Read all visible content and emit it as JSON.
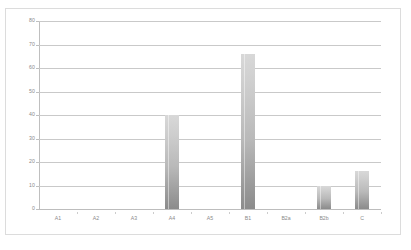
{
  "chart_data": {
    "type": "bar",
    "title": "",
    "subtitle": "",
    "xlabel": "",
    "ylabel": "",
    "categories": [
      "A1",
      "A2",
      "A3",
      "A4",
      "A5",
      "B1",
      "B2a",
      "B2b",
      "C"
    ],
    "values": [
      0,
      0,
      0,
      40,
      0,
      66,
      0,
      10,
      16
    ],
    "ylim": [
      0,
      80
    ],
    "ytick_labels": [
      "0",
      "10",
      "20",
      "30",
      "40",
      "50",
      "60",
      "70",
      "80"
    ],
    "ytick_values": [
      0,
      10,
      20,
      30,
      40,
      50,
      60,
      70,
      80
    ],
    "grid": "horizontal",
    "legend": "none",
    "bar_color_top": "#d8d8d8",
    "bar_color_bottom": "#8b8b8b",
    "gridline_color": "#c9c9c9",
    "axis_color": "#bfbfbf",
    "tick_label_color": "#8a8a8a",
    "plot_background": "#ffffff",
    "frame_border_color": "#dcdcdc"
  }
}
